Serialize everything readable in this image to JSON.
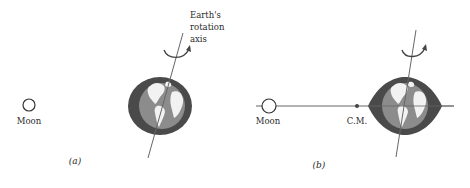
{
  "figure": {
    "panel_a": {
      "caption": "(a)",
      "moon_label": "Moon",
      "axis_label_lines": [
        "Earth's",
        "rotation",
        "axis"
      ]
    },
    "panel_b": {
      "caption": "(b)",
      "moon_label": "Moon",
      "cm_label": "C.M."
    }
  },
  "colors": {
    "ring": "#4a4a4a",
    "globe": "#8c8c8c",
    "continents": "#f2f2f2",
    "line": "#555555"
  }
}
